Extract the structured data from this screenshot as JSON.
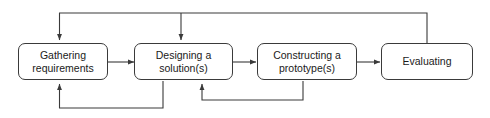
{
  "diagram": {
    "type": "flowchart",
    "orientation": "left-to-right",
    "background_color": "#ffffff",
    "stroke_color": "#3a3a3a",
    "text_color": "#1a1a1a",
    "nodes": [
      {
        "id": "gathering-requirements",
        "label": "Gathering\nrequirements",
        "shape": "rounded-rectangle"
      },
      {
        "id": "designing-a-solution",
        "label": "Designing a\nsolution(s)",
        "shape": "rounded-rectangle"
      },
      {
        "id": "constructing-a-prototype",
        "label": "Constructing a\nprototype(s)",
        "shape": "rounded-rectangle"
      },
      {
        "id": "evaluating",
        "label": "Evaluating",
        "shape": "rounded-rectangle"
      }
    ],
    "edges": [
      {
        "from": "gathering-requirements",
        "to": "designing-a-solution",
        "kind": "forward"
      },
      {
        "from": "designing-a-solution",
        "to": "constructing-a-prototype",
        "kind": "forward"
      },
      {
        "from": "constructing-a-prototype",
        "to": "evaluating",
        "kind": "forward"
      },
      {
        "from": "evaluating",
        "to": "gathering-requirements",
        "kind": "feedback-top"
      },
      {
        "from": "evaluating",
        "to": "designing-a-solution",
        "kind": "feedback-top"
      },
      {
        "from": "designing-a-solution",
        "to": "gathering-requirements",
        "kind": "feedback-bottom"
      },
      {
        "from": "constructing-a-prototype",
        "to": "designing-a-solution",
        "kind": "feedback-bottom"
      }
    ]
  }
}
